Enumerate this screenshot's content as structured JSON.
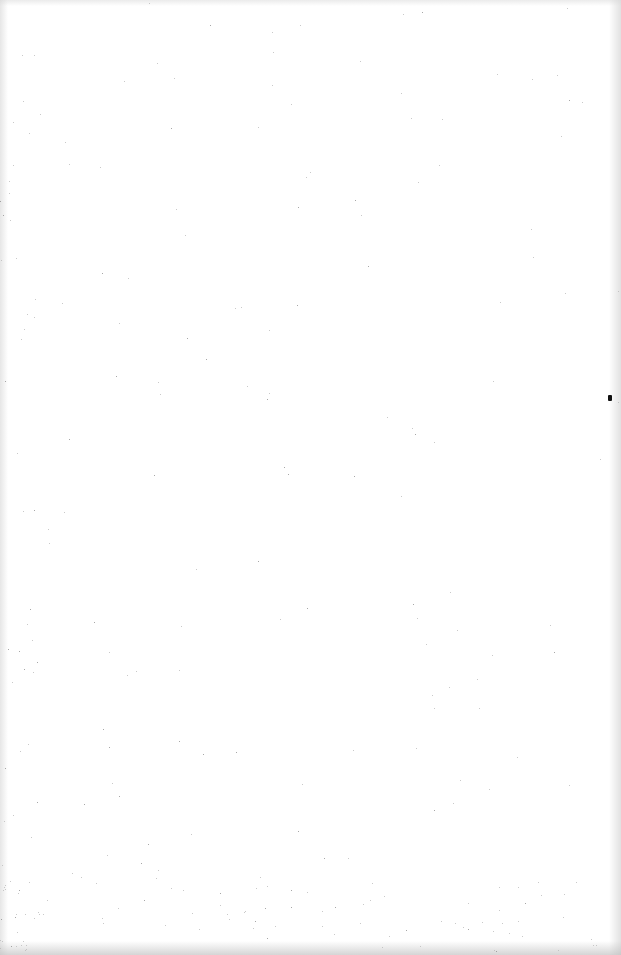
{
  "page": {
    "type": "blank-scanned-page",
    "background_color": "#ffffff",
    "text_content": ""
  },
  "artifacts": {
    "mark": {
      "x": 608,
      "y": 395,
      "color": "#111111"
    }
  }
}
